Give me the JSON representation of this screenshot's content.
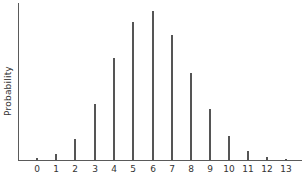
{
  "chart_data": {
    "type": "bar",
    "title": "",
    "xlabel": "",
    "ylabel": "Probability",
    "categories": [
      "0",
      "1",
      "2",
      "3",
      "4",
      "5",
      "6",
      "7",
      "8",
      "9",
      "10",
      "11",
      "12",
      "13"
    ],
    "values": [
      0.013,
      0.04,
      0.141,
      0.376,
      0.685,
      0.926,
      1.0,
      0.839,
      0.584,
      0.342,
      0.161,
      0.06,
      0.02,
      0.007
    ],
    "value_note": "Relative heights (normalized to tallest bar = 1); y-axis has no numeric tick labels",
    "ylim": [
      0,
      1.05
    ],
    "grid": false,
    "legend": null,
    "style": "thin vertical line bars (spike plot)"
  },
  "layout": {
    "axis_color": "#5a5a5a",
    "bar_color": "#555555",
    "baseline_y": 160,
    "plot_height_px": 149,
    "x_positions": [
      37,
      56,
      75,
      95,
      114,
      133,
      153,
      172,
      191,
      210,
      229,
      248,
      267,
      286
    ]
  }
}
